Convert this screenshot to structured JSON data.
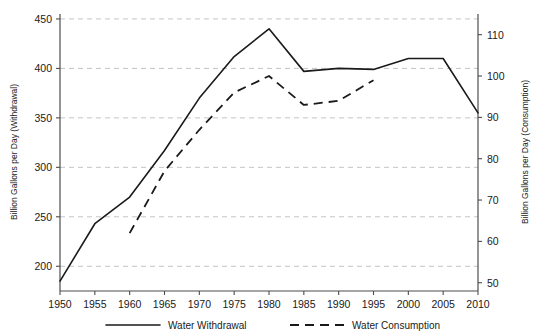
{
  "chart_data": {
    "type": "line",
    "title": "",
    "xlabel": "",
    "ylabel": "Billion Gallons per Day (Withdrawal)",
    "y2label": "Billion Gallons per Day (Consumption)",
    "x": [
      1950,
      1955,
      1960,
      1965,
      1970,
      1975,
      1980,
      1985,
      1990,
      1995,
      2000,
      2005,
      2010
    ],
    "xticklabels": [
      "1950",
      "1955",
      "1960",
      "1965",
      "1970",
      "1975",
      "1980",
      "1985",
      "1990",
      "1995",
      "2000",
      "2005",
      "2010"
    ],
    "xlim": [
      1950,
      2010
    ],
    "ylim": [
      175,
      455
    ],
    "yticks": [
      200,
      250,
      300,
      350,
      400,
      450
    ],
    "yticklabels": [
      "200",
      "250",
      "300",
      "350",
      "400",
      "450"
    ],
    "y2lim": [
      48,
      115
    ],
    "y2ticks": [
      50,
      60,
      70,
      80,
      90,
      100,
      110
    ],
    "y2ticklabels": [
      "50",
      "60",
      "70",
      "80",
      "90",
      "100",
      "110"
    ],
    "grid": "horizontal-dashed",
    "legend_position": "bottom",
    "series": [
      {
        "name": "Water Withdrawal",
        "axis": "left",
        "style": "solid",
        "x": [
          1950,
          1955,
          1960,
          1965,
          1970,
          1975,
          1980,
          1985,
          1990,
          1995,
          2000,
          2005,
          2010
        ],
        "values": [
          185,
          243,
          270,
          317,
          370,
          412,
          440,
          397,
          400,
          399,
          410,
          410,
          355
        ]
      },
      {
        "name": "Water Consumption",
        "axis": "right",
        "style": "dashed",
        "x": [
          1960,
          1965,
          1970,
          1975,
          1980,
          1985,
          1990,
          1995
        ],
        "values": [
          62,
          77,
          87,
          96,
          100,
          93,
          94,
          99
        ]
      }
    ],
    "legend": [
      {
        "label": "Water Withdrawal",
        "style": "solid"
      },
      {
        "label": "Water Consumption",
        "style": "dashed"
      }
    ]
  }
}
